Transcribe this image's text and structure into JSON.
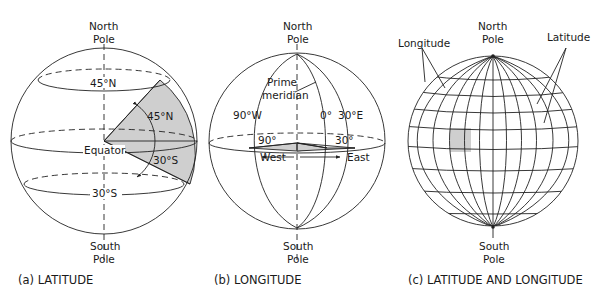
{
  "panels": [
    {
      "id": "a",
      "caption": "(a) LATITUDE",
      "north_pole": [
        "North",
        "Pole"
      ],
      "south_pole": [
        "South",
        "Pole"
      ],
      "labels": {
        "lat_45n_ring": "45°N",
        "lat_45n_angle": "45°N",
        "equator": "Equator",
        "lat_30s_angle": "30°S",
        "lat_30s_ring": "30°S"
      }
    },
    {
      "id": "b",
      "caption": "(b) LONGITUDE",
      "north_pole": [
        "North",
        "Pole"
      ],
      "south_pole": [
        "South",
        "Pole"
      ],
      "labels": {
        "prime_meridian": [
          "Prime",
          "meridian"
        ],
        "lon_90w": "90°W",
        "lon_0": "0°",
        "lon_30e": "30°E",
        "angle_90": "90°",
        "angle_30": "30°",
        "west": "West",
        "east": "East"
      }
    },
    {
      "id": "c",
      "caption": "(c) LATITUDE AND LONGITUDE",
      "north_pole": [
        "North",
        "Pole"
      ],
      "south_pole": [
        "South",
        "Pole"
      ],
      "labels": {
        "longitude": "Longitude",
        "latitude": "Latitude"
      }
    }
  ],
  "colors": {
    "line": "#222222",
    "shade": "#cfcfcf",
    "background": "#ffffff"
  }
}
